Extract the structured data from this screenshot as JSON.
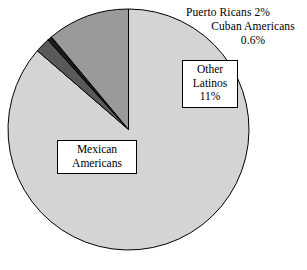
{
  "chart_data": {
    "type": "pie",
    "title": "",
    "subtitle": "",
    "xlabel": "",
    "ylabel": "",
    "legend_position": "none",
    "grid": false,
    "units": "percent",
    "categories": [
      "Mexican Americans",
      "Puerto Ricans",
      "Cuban Americans",
      "Other Latinos"
    ],
    "values": [
      86,
      2,
      0.6,
      11
    ],
    "value_labels": [
      "86%",
      "2%",
      "0.6%",
      "11%"
    ],
    "colors": [
      "#d4d4d4",
      "#595959",
      "#1a1a1a",
      "#9a9a9a"
    ],
    "slices": [
      {
        "name": "Mexican Americans",
        "value": 86,
        "value_label": "86%",
        "color": "#d4d4d4",
        "label_placement": "inside-box",
        "label_lines": [
          "Mexican",
          "Americans",
          "86%"
        ]
      },
      {
        "name": "Puerto Ricans",
        "value": 2,
        "value_label": "2%",
        "color": "#595959",
        "label_placement": "outside",
        "label_lines": [
          "Puerto Ricans 2%"
        ]
      },
      {
        "name": "Cuban Americans",
        "value": 0.6,
        "value_label": "0.6%",
        "color": "#1a1a1a",
        "label_placement": "outside",
        "label_lines": [
          "Cuban Americans",
          "0.6%"
        ]
      },
      {
        "name": "Other Latinos",
        "value": 11,
        "value_label": "11%",
        "color": "#9a9a9a",
        "label_placement": "inside-box",
        "label_lines": [
          "Other",
          "Latinos",
          "11%"
        ]
      }
    ],
    "geometry": {
      "center_x": 128.5,
      "center_y": 129.5,
      "radius": 120.5,
      "start_angle_deg": -90,
      "direction": "clockwise",
      "stroke_color": "#000000",
      "stroke_width": 1
    }
  },
  "labels": {
    "puerto_ricans": "Puerto Ricans 2%",
    "cuban_americans_line1": "Cuban Americans",
    "cuban_americans_line2": "0.6%",
    "other_latinos_line1": "Other",
    "other_latinos_line2": "Latinos",
    "other_latinos_line3": "11%",
    "mexican_americans_line1": "Mexican",
    "mexican_americans_line2": "Americans",
    "mexican_americans_line3": "86%"
  }
}
